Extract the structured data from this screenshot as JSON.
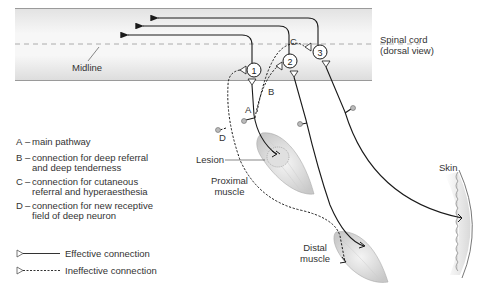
{
  "labels": {
    "spinal_cord_line1": "Spinal cord",
    "spinal_cord_line2": "(dorsal view)",
    "midline": "Midline",
    "lesion": "Lesion",
    "proximal_line1": "Proximal",
    "proximal_line2": "muscle",
    "distal_line1": "Distal",
    "distal_line2": "muscle",
    "skin": "Skin",
    "path_a": "A",
    "path_b": "B",
    "path_c": "C",
    "path_d": "D",
    "neuron_1": "1",
    "neuron_2": "2",
    "neuron_3": "3"
  },
  "legend": {
    "items": [
      {
        "key": "A",
        "dash": "–",
        "line1": "main pathway",
        "line2": ""
      },
      {
        "key": "B",
        "dash": "–",
        "line1": "connection for deep referral",
        "line2": "and deep tenderness"
      },
      {
        "key": "C",
        "dash": "–",
        "line1": "connection for cutaneous",
        "line2": "referral and hyperaesthesia"
      },
      {
        "key": "D",
        "dash": "–",
        "line1": "connection for new receptive",
        "line2": "field of deep neuron"
      }
    ],
    "effective": "Effective connection",
    "ineffective": "Ineffective connection"
  },
  "colors": {
    "cord_fill": "#e6e6e6",
    "cord_border": "#9a9a9a",
    "line": "#1a1a1a",
    "muscle": "#d8d8d8",
    "text": "#333333"
  }
}
